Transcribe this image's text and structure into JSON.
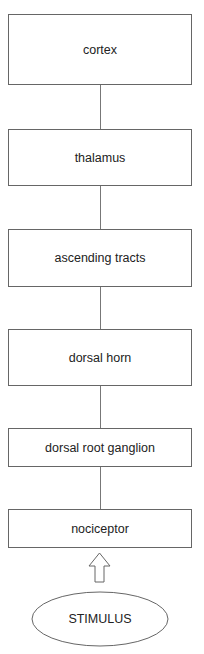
{
  "diagram": {
    "type": "vertical flowchart",
    "nodes": [
      {
        "id": "cortex",
        "label": "cortex"
      },
      {
        "id": "thalamus",
        "label": "thalamus"
      },
      {
        "id": "ascending_tracts",
        "label": "ascending tracts"
      },
      {
        "id": "dorsal_horn",
        "label": "dorsal horn"
      },
      {
        "id": "dorsal_root_ganglion",
        "label": "dorsal root ganglion"
      },
      {
        "id": "nociceptor",
        "label": "nociceptor"
      }
    ],
    "stimulus": {
      "label": "STIMULUS",
      "shape": "ellipse"
    },
    "edges": [
      {
        "from": "cortex",
        "to": "thalamus",
        "style": "line"
      },
      {
        "from": "thalamus",
        "to": "ascending_tracts",
        "style": "line"
      },
      {
        "from": "ascending_tracts",
        "to": "dorsal_horn",
        "style": "line"
      },
      {
        "from": "dorsal_horn",
        "to": "dorsal_root_ganglion",
        "style": "line"
      },
      {
        "from": "dorsal_root_ganglion",
        "to": "nociceptor",
        "style": "line"
      },
      {
        "from": "stimulus",
        "to": "nociceptor",
        "style": "hollow-up-arrow"
      }
    ],
    "colors": {
      "stroke": "#666666",
      "text": "#222222",
      "background": "#ffffff"
    }
  }
}
